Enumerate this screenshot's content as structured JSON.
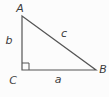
{
  "diagram": {
    "type": "right-triangle",
    "vertex_labels": {
      "top": "A",
      "bottom_right": "B",
      "bottom_left": "C"
    },
    "side_labels": {
      "vertical_leg": "b",
      "horizontal_leg": "a",
      "hypotenuse": "c"
    },
    "right_angle_at_vertex": "C",
    "line_color": "#555555",
    "text_color": "#3c3c3c",
    "background_color": "#fcfcfc"
  }
}
